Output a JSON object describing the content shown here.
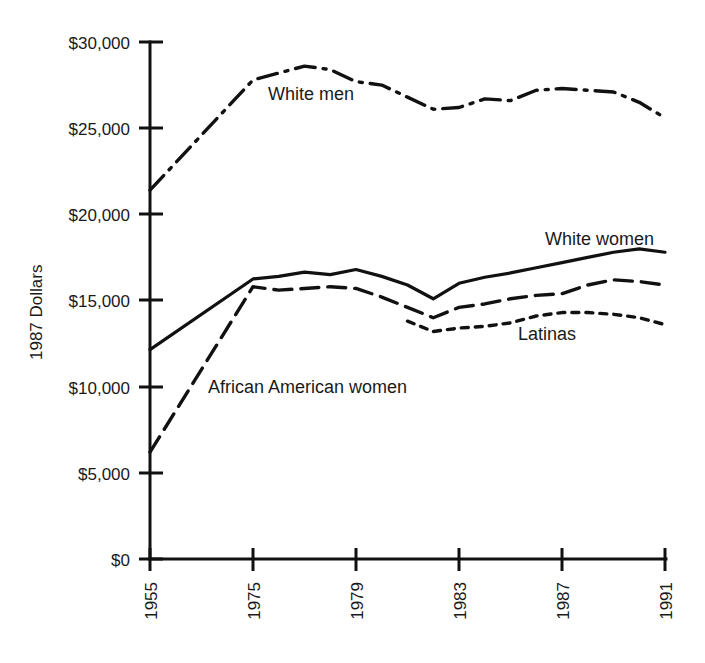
{
  "chart_data": {
    "type": "line",
    "title": "",
    "subtitle": "",
    "xlabel": "",
    "ylabel": "1987 Dollars",
    "x_tick_labels": [
      "1955",
      "1975",
      "1979",
      "1983",
      "1987",
      "1991"
    ],
    "x_tick_values": [
      1955,
      1975,
      1979,
      1983,
      1987,
      1991
    ],
    "x_axis_note": "non-linear spacing: 1955 and 1975 are adjacent ticks at equal pixel spacing to the 4-year ticks",
    "y_tick_labels": [
      "$0",
      "$5,000",
      "$10,000",
      "$15,000",
      "$20,000",
      "$25,000",
      "$30,000"
    ],
    "y_tick_values": [
      0,
      5000,
      10000,
      15000,
      20000,
      25000,
      30000
    ],
    "ylim": [
      0,
      30000
    ],
    "grid": false,
    "legend_position": "inline-annotations",
    "series": [
      {
        "name": "White men",
        "label": "White men",
        "style": "dash-dot",
        "color": "#111111",
        "label_x": 268,
        "label_y": 100,
        "x": [
          1955,
          1975,
          1976,
          1977,
          1978,
          1979,
          1980,
          1981,
          1982,
          1983,
          1984,
          1985,
          1986,
          1987,
          1988,
          1989,
          1990,
          1991
        ],
        "values": [
          21400,
          27800,
          28200,
          28600,
          28400,
          27700,
          27500,
          26800,
          26100,
          26200,
          26700,
          26600,
          27200,
          27300,
          27200,
          27100,
          26500,
          25600
        ]
      },
      {
        "name": "White women",
        "label": "White women",
        "style": "solid",
        "color": "#111111",
        "label_x": 545,
        "label_y": 245,
        "x": [
          1955,
          1975,
          1976,
          1977,
          1978,
          1979,
          1980,
          1981,
          1982,
          1983,
          1984,
          1985,
          1986,
          1987,
          1988,
          1989,
          1990,
          1991
        ],
        "values": [
          12150,
          16250,
          16400,
          16650,
          16500,
          16800,
          16400,
          15900,
          15100,
          16000,
          16350,
          16600,
          16900,
          17200,
          17500,
          17800,
          18000,
          17800
        ]
      },
      {
        "name": "African American women",
        "label": "African American women",
        "style": "dashed",
        "color": "#111111",
        "label_x": 208,
        "label_y": 393,
        "x": [
          1955,
          1975,
          1976,
          1977,
          1978,
          1979,
          1980,
          1981,
          1982,
          1983,
          1984,
          1985,
          1986,
          1987,
          1988,
          1989,
          1990,
          1991
        ],
        "values": [
          6200,
          15800,
          15600,
          15700,
          15800,
          15700,
          15200,
          14600,
          14000,
          14600,
          14800,
          15100,
          15300,
          15400,
          15900,
          16200,
          16100,
          15900
        ]
      },
      {
        "name": "Latinas",
        "label": "Latinas",
        "style": "dotted",
        "color": "#111111",
        "label_x": 518,
        "label_y": 340,
        "x": [
          1981,
          1982,
          1983,
          1984,
          1985,
          1986,
          1987,
          1988,
          1989,
          1990,
          1991
        ],
        "values": [
          13800,
          13200,
          13400,
          13500,
          13700,
          14100,
          14300,
          14300,
          14200,
          14000,
          13600
        ]
      }
    ]
  }
}
